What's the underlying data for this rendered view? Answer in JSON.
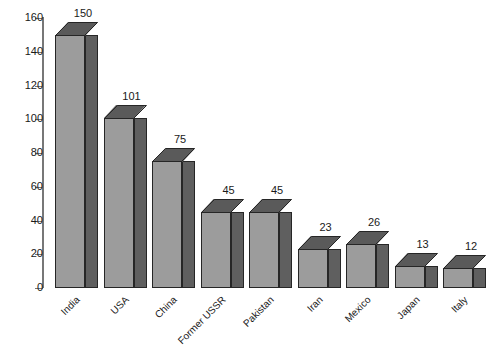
{
  "chart_data": {
    "type": "bar",
    "title": "",
    "subtitle": "",
    "xlabel": "",
    "ylabel": "",
    "categories": [
      "India",
      "USA",
      "China",
      "Former USSR",
      "Pakistan",
      "Iran",
      "Mexico",
      "Japan",
      "Italy"
    ],
    "values": [
      150,
      101,
      75,
      45,
      45,
      23,
      26,
      13,
      12
    ],
    "series": [
      {
        "name": "",
        "values": [
          150,
          101,
          75,
          45,
          45,
          23,
          26,
          13,
          12
        ]
      }
    ],
    "data_labels": [
      "150",
      "101",
      "75",
      "45",
      "45",
      "23",
      "26",
      "13",
      "12"
    ],
    "ylim": [
      0,
      160
    ],
    "ytick_values": [
      0,
      20,
      40,
      60,
      80,
      100,
      120,
      140,
      160
    ],
    "ytick_labels": [
      "0",
      "20",
      "40",
      "60",
      "80",
      "100",
      "120",
      "140",
      "160"
    ],
    "grid": false,
    "legend": false,
    "legend_position": "none",
    "style_3d": true,
    "colors": {
      "bar_front": "#9c9c9c",
      "bar_side": "#5f5f5f",
      "bar_top": "#5a5a5a",
      "bar_outline": "#262626",
      "axis": "#777777",
      "text": "#1a1a1a",
      "background": "#ffffff"
    }
  }
}
